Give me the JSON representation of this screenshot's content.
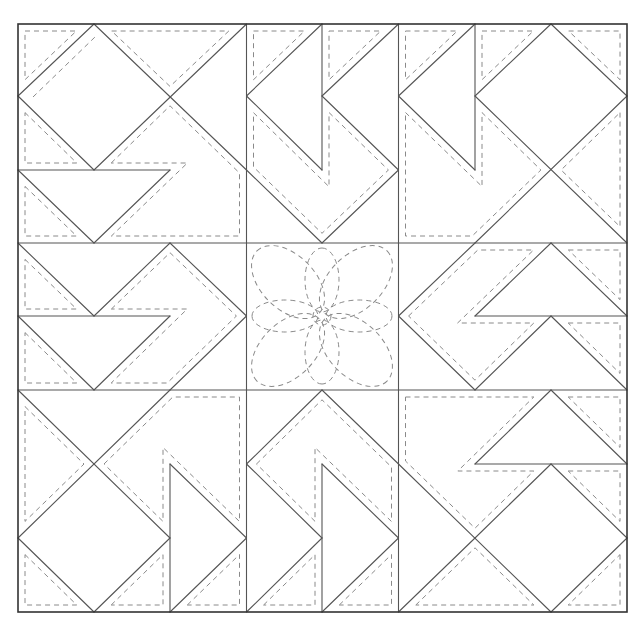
{
  "diagram": {
    "type": "quilt-block-pattern",
    "grid": {
      "rows": 3,
      "columns": 3
    },
    "blocks": [
      {
        "id": "top-left",
        "name": "pinwheel-arrow-block"
      },
      {
        "id": "top-middle",
        "name": "flying-geese-block"
      },
      {
        "id": "top-right",
        "name": "square-in-square-block"
      },
      {
        "id": "middle-left",
        "name": "arrow-block"
      },
      {
        "id": "center",
        "name": "flower-quilting-block",
        "motif": "8-petal flower"
      },
      {
        "id": "middle-right",
        "name": "arrow-block"
      },
      {
        "id": "bottom-left",
        "name": "square-in-square-block"
      },
      {
        "id": "bottom-middle",
        "name": "flying-geese-block"
      },
      {
        "id": "bottom-right",
        "name": "square-in-square-block"
      }
    ],
    "legend": {
      "solid_line": "seam line",
      "dashed_line": "quilting line"
    }
  },
  "colors": {
    "background": "#ffffff",
    "border": "#333333",
    "seam": "#555555",
    "quilting": "#8a8a8a"
  }
}
